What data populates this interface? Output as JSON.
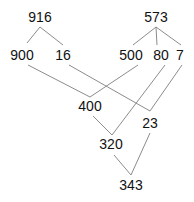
{
  "diagram": {
    "type": "tree-merge",
    "nodes": [
      {
        "id": "n916",
        "label": "916",
        "x": 40,
        "y": 22
      },
      {
        "id": "n900",
        "label": "900",
        "x": 22,
        "y": 60
      },
      {
        "id": "n16",
        "label": "16",
        "x": 63,
        "y": 60
      },
      {
        "id": "n573",
        "label": "573",
        "x": 156,
        "y": 22
      },
      {
        "id": "n500",
        "label": "500",
        "x": 131,
        "y": 60
      },
      {
        "id": "n80",
        "label": "80",
        "x": 161,
        "y": 60
      },
      {
        "id": "n7",
        "label": "7",
        "x": 180,
        "y": 60
      },
      {
        "id": "n400",
        "label": "400",
        "x": 90,
        "y": 111
      },
      {
        "id": "n23",
        "label": "23",
        "x": 150,
        "y": 128
      },
      {
        "id": "n320",
        "label": "320",
        "x": 111,
        "y": 149
      },
      {
        "id": "n343",
        "label": "343",
        "x": 131,
        "y": 190
      }
    ],
    "edges": [
      {
        "x1": 40,
        "y1": 27,
        "x2": 27,
        "y2": 43
      },
      {
        "x1": 40,
        "y1": 27,
        "x2": 63,
        "y2": 45
      },
      {
        "x1": 156,
        "y1": 27,
        "x2": 133,
        "y2": 45
      },
      {
        "x1": 156,
        "y1": 27,
        "x2": 157,
        "y2": 45
      },
      {
        "x1": 156,
        "y1": 27,
        "x2": 181,
        "y2": 45
      },
      {
        "x1": 28,
        "y1": 65,
        "x2": 90,
        "y2": 97
      },
      {
        "x1": 138,
        "y1": 65,
        "x2": 90,
        "y2": 97
      },
      {
        "x1": 69,
        "y1": 65,
        "x2": 150,
        "y2": 111
      },
      {
        "x1": 182,
        "y1": 65,
        "x2": 150,
        "y2": 111
      },
      {
        "x1": 165,
        "y1": 65,
        "x2": 112,
        "y2": 135
      },
      {
        "x1": 93,
        "y1": 116,
        "x2": 112,
        "y2": 135
      },
      {
        "x1": 114,
        "y1": 155,
        "x2": 131,
        "y2": 175
      },
      {
        "x1": 150,
        "y1": 133,
        "x2": 131,
        "y2": 175
      }
    ]
  }
}
